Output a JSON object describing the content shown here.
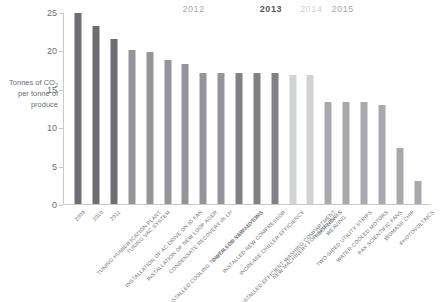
{
  "chart_data": {
    "type": "bar",
    "title": "",
    "subtitle": "",
    "xlabel": "",
    "ylabel": "Tonnes of CO2 per tonne of produce",
    "ylim": [
      0,
      25
    ],
    "yticks": [
      0,
      5,
      10,
      15,
      20,
      25
    ],
    "grid": false,
    "legend_position": "none",
    "categories": [
      "2009",
      "2010",
      "2011",
      "TUNING HUMIDIFICATION PLANT",
      "TUNING VAC SYSTEM",
      "INSTALLATION OF AC DRIVE ON ID FAN",
      "INSTALLATION OF NEW LOOP AGER",
      "CONDENSATE RECOVERY IN LH",
      "INSTALLED COOLING TOWER FOR YARN DYEING",
      "INSTALLED NEW MOTORS",
      "INSTALLED NEW COMPRESSOR",
      "INCREASE CHILLER EFFICIENCY",
      "INSTALLED EFFICIENT WASHING COMPARTMENT",
      "NEW MACHINERY FOR SPINNING + WEAVING",
      "ROOFLIGHTS",
      "TWO-SIDED UTILITY STRIPS",
      "WATER-COOLED MOTORS",
      "PAX SCIENTIFIC FANS",
      "BIOMASS CHIP",
      "PHOTOVOLTAICS"
    ],
    "values": [
      25.0,
      23.3,
      21.6,
      20.2,
      19.9,
      18.9,
      18.3,
      17.1,
      17.1,
      17.1,
      17.1,
      17.1,
      16.9,
      16.9,
      13.4,
      13.4,
      13.3,
      12.9,
      7.3,
      3.0
    ],
    "bar_colors": [
      "#6d6e71",
      "#6d6e71",
      "#6d6e71",
      "#939598",
      "#939598",
      "#939598",
      "#939598",
      "#939598",
      "#939598",
      "#808184",
      "#808184",
      "#808184",
      "#d1d3d4",
      "#d1d3d4",
      "#a7a9ac",
      "#a7a9ac",
      "#a7a9ac",
      "#a7a9ac",
      "#a7a9ac",
      "#a7a9ac"
    ],
    "year_groups": [
      {
        "label": "2012",
        "color": "#a7a9ac",
        "weight": "normal",
        "center_pct": 0.355
      },
      {
        "label": "2013",
        "color": "#58595b",
        "weight": "bold",
        "center_pct": 0.565
      },
      {
        "label": "2014",
        "color": "#d1d3d4",
        "weight": "normal",
        "center_pct": 0.675
      },
      {
        "label": "2015",
        "color": "#a7a9ac",
        "weight": "normal",
        "center_pct": 0.76
      }
    ]
  },
  "axis": {
    "title_line1": "Tonnes of CO",
    "title_sub": "2",
    "title_line2": "per tonne of",
    "title_line3": "produce"
  }
}
